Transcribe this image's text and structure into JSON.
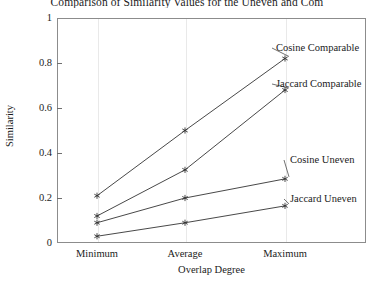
{
  "chart_data": {
    "type": "line",
    "title": "Comparison of Similarity Values for the Uneven and Com",
    "xlabel": "Overlap Degree",
    "ylabel": "Similarity",
    "categories": [
      "Minimum",
      "Average",
      "Maximum"
    ],
    "ylim": [
      0,
      1
    ],
    "yticks": [
      "0",
      "0.2",
      "0.4",
      "0.6",
      "0.8",
      "1"
    ],
    "ytick_values": [
      0,
      0.2,
      0.4,
      0.6,
      0.8,
      1
    ],
    "grid": "vertical-only",
    "legend_position": "inline-annotations",
    "marker": "asterisk",
    "line_color": "#333333",
    "series": [
      {
        "name": "Cosine Comparable",
        "values": [
          0.21,
          0.5,
          0.82
        ],
        "label_x": 276,
        "label_y": 48
      },
      {
        "name": "Jaccard Comparable",
        "values": [
          0.12,
          0.325,
          0.68
        ],
        "label_x": 276,
        "label_y": 84
      },
      {
        "name": "Cosine Uneven",
        "values": [
          0.09,
          0.2,
          0.285
        ],
        "label_x": 288,
        "label_y": 160
      },
      {
        "name": "Jaccard Uneven",
        "values": [
          0.03,
          0.09,
          0.165
        ],
        "label_x": 288,
        "label_y": 199
      }
    ]
  },
  "axes": {
    "plot_left": 57,
    "plot_right": 366,
    "plot_top": 18,
    "plot_bottom": 243,
    "category_x": [
      97,
      185,
      285
    ]
  }
}
